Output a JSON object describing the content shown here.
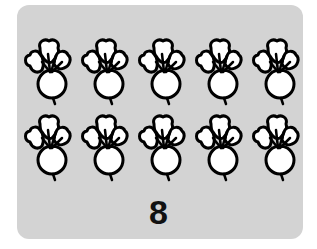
{
  "card": {
    "background": "#d3d3d3"
  },
  "rows": [
    {
      "items": [
        "radish",
        "radish",
        "radish",
        "radish",
        "radish"
      ]
    },
    {
      "items": [
        "radish",
        "radish",
        "radish",
        "radish",
        "radish"
      ]
    }
  ],
  "item_icon": "radish-icon",
  "count_label": "8"
}
